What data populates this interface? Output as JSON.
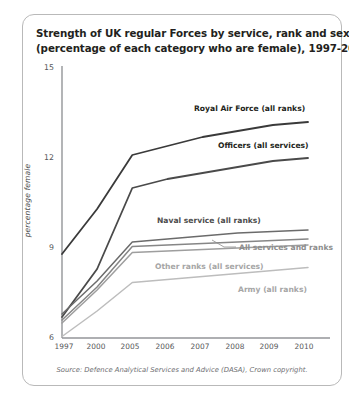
{
  "figure": {
    "title_line1": "Strength of UK regular Forces by service, rank and sex",
    "title_line2": "(percentage of each category who are female), 1997-2010",
    "source": "Source: Defence Analytical Services and Advice (DASA), Crown copyright."
  },
  "chart_data": {
    "type": "line",
    "title": "Strength of UK regular Forces by service, rank and sex (percentage of each category who are female), 1997-2010",
    "xlabel": "",
    "ylabel": "percentage female",
    "ylim": [
      6,
      15
    ],
    "yticks": [
      6,
      9,
      12,
      15
    ],
    "x": [
      "1997",
      "2000",
      "2005",
      "2006",
      "2007",
      "2008",
      "2009",
      "2010"
    ],
    "categories": [
      "1997",
      "2000",
      "2005",
      "2006",
      "2007",
      "2008",
      "2009",
      "2010"
    ],
    "grid": false,
    "legend_position": "inline-annotations",
    "series": [
      {
        "name": "Royal Air Force (all ranks)",
        "color": "#3a3a3a",
        "values": [
          8.8,
          10.3,
          12.1,
          12.4,
          12.7,
          12.9,
          13.1,
          13.2
        ]
      },
      {
        "name": "Officers (all services)",
        "color": "#4a4a4a",
        "values": [
          6.7,
          8.3,
          11.0,
          11.3,
          11.5,
          11.7,
          11.9,
          12.0
        ]
      },
      {
        "name": "Naval service (all ranks)",
        "color": "#6b6b6b",
        "values": [
          6.8,
          7.9,
          9.2,
          9.3,
          9.4,
          9.5,
          9.55,
          9.6
        ]
      },
      {
        "name": "All services and ranks",
        "color": "#868686",
        "values": [
          6.6,
          7.7,
          9.05,
          9.1,
          9.15,
          9.2,
          9.25,
          9.3
        ]
      },
      {
        "name": "Other ranks (all services)",
        "color": "#9e9e9e",
        "values": [
          6.5,
          7.6,
          8.85,
          8.9,
          8.95,
          9.0,
          9.05,
          9.1
        ]
      },
      {
        "name": "Army (all ranks)",
        "color": "#bdbdbd",
        "values": [
          6.05,
          6.9,
          7.85,
          7.95,
          8.05,
          8.15,
          8.25,
          8.35
        ]
      }
    ],
    "annotations": [
      {
        "text": "Royal Air Force (all ranks)",
        "series": "Royal Air Force (all ranks)"
      },
      {
        "text": "Officers (all services)",
        "series": "Officers (all services)"
      },
      {
        "text": "Naval service (all ranks)",
        "series": "Naval service (all ranks)"
      },
      {
        "text": "All services and ranks",
        "series": "All services and ranks"
      },
      {
        "text": "Other ranks (all services)",
        "series": "Other ranks (all services)"
      },
      {
        "text": "Army (all ranks)",
        "series": "Army (all ranks)"
      }
    ]
  },
  "axis": {
    "y_ticks": [
      "15",
      "12",
      "9",
      "6"
    ],
    "x_ticks": [
      "1997",
      "2000",
      "2005",
      "2006",
      "2007",
      "2008",
      "2009",
      "2010"
    ],
    "y_title": "percentage female"
  }
}
